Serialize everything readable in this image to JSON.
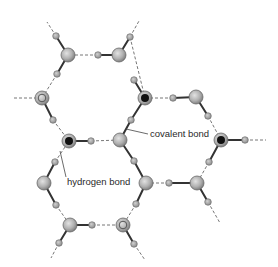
{
  "diagram": {
    "labels": {
      "covalent": "covalent bond",
      "hydrogen": "hydrogen bond"
    },
    "colors": {
      "oxygen_fill": "#b8b8b8",
      "oxygen_stroke": "#6a6a6a",
      "oxygen_dark": "#111111",
      "hydrogen_fill": "#a8a8a8",
      "covalent_line": "#333333",
      "hbond_line": "#777777",
      "text": "#2a2a2a"
    },
    "oxygens": [
      {
        "id": "O1",
        "x": 68,
        "y": 55,
        "style": "plain"
      },
      {
        "id": "O2",
        "x": 119,
        "y": 55,
        "style": "plain"
      },
      {
        "id": "O3",
        "x": 42,
        "y": 98,
        "style": "ringed"
      },
      {
        "id": "O4",
        "x": 145,
        "y": 98,
        "style": "dark"
      },
      {
        "id": "O5",
        "x": 196,
        "y": 97,
        "style": "plain"
      },
      {
        "id": "O6",
        "x": 69,
        "y": 141,
        "style": "dark"
      },
      {
        "id": "O7",
        "x": 120,
        "y": 140,
        "style": "plain"
      },
      {
        "id": "O8",
        "x": 221,
        "y": 140,
        "style": "dark"
      },
      {
        "id": "O9",
        "x": 44,
        "y": 183,
        "style": "plain"
      },
      {
        "id": "O10",
        "x": 146,
        "y": 183,
        "style": "plain"
      },
      {
        "id": "O11",
        "x": 197,
        "y": 183,
        "style": "plain"
      },
      {
        "id": "O12",
        "x": 70,
        "y": 225,
        "style": "plain"
      },
      {
        "id": "O13",
        "x": 123,
        "y": 225,
        "style": "ringed"
      }
    ],
    "hydrogens": [
      {
        "x": 56,
        "y": 36
      },
      {
        "x": 130,
        "y": 37
      },
      {
        "x": 98,
        "y": 55
      },
      {
        "x": 57,
        "y": 74
      },
      {
        "x": 134,
        "y": 80
      },
      {
        "x": 53,
        "y": 120
      },
      {
        "x": 131,
        "y": 120
      },
      {
        "x": 173,
        "y": 98
      },
      {
        "x": 208,
        "y": 116
      },
      {
        "x": 91,
        "y": 141
      },
      {
        "x": 55,
        "y": 162
      },
      {
        "x": 134,
        "y": 161
      },
      {
        "x": 209,
        "y": 162
      },
      {
        "x": 245,
        "y": 140
      },
      {
        "x": 56,
        "y": 205
      },
      {
        "x": 169,
        "y": 183
      },
      {
        "x": 136,
        "y": 204
      },
      {
        "x": 208,
        "y": 202
      },
      {
        "x": 92,
        "y": 225
      },
      {
        "x": 59,
        "y": 243
      },
      {
        "x": 134,
        "y": 244
      }
    ],
    "covalent_bonds": [
      [
        68,
        55,
        56,
        36
      ],
      [
        68,
        55,
        57,
        74
      ],
      [
        119,
        55,
        130,
        37
      ],
      [
        119,
        55,
        98,
        55
      ],
      [
        42,
        98,
        53,
        120
      ],
      [
        145,
        98,
        134,
        80
      ],
      [
        145,
        98,
        131,
        120
      ],
      [
        196,
        97,
        173,
        98
      ],
      [
        196,
        97,
        208,
        116
      ],
      [
        69,
        141,
        91,
        141
      ],
      [
        120,
        140,
        131,
        120
      ],
      [
        120,
        140,
        134,
        161
      ],
      [
        221,
        140,
        245,
        140
      ],
      [
        221,
        140,
        209,
        162
      ],
      [
        44,
        183,
        55,
        162
      ],
      [
        44,
        183,
        56,
        205
      ],
      [
        146,
        183,
        134,
        161
      ],
      [
        146,
        183,
        136,
        204
      ],
      [
        197,
        183,
        169,
        183
      ],
      [
        197,
        183,
        208,
        202
      ],
      [
        70,
        225,
        92,
        225
      ],
      [
        70,
        225,
        59,
        243
      ],
      [
        123,
        225,
        134,
        244
      ]
    ],
    "hydrogen_bonds": [
      [
        56,
        36,
        47,
        22
      ],
      [
        130,
        37,
        139,
        21
      ],
      [
        98,
        55,
        68,
        55
      ],
      [
        57,
        74,
        42,
        98
      ],
      [
        130,
        37,
        145,
        98
      ],
      [
        42,
        98,
        12,
        98
      ],
      [
        53,
        120,
        69,
        141
      ],
      [
        173,
        98,
        145,
        98
      ],
      [
        208,
        116,
        221,
        140
      ],
      [
        91,
        141,
        120,
        140
      ],
      [
        245,
        140,
        266,
        140
      ],
      [
        55,
        162,
        69,
        141
      ],
      [
        209,
        162,
        197,
        183
      ],
      [
        56,
        205,
        70,
        225
      ],
      [
        169,
        183,
        146,
        183
      ],
      [
        136,
        204,
        123,
        225
      ],
      [
        208,
        202,
        220,
        223
      ],
      [
        92,
        225,
        123,
        225
      ],
      [
        59,
        243,
        51,
        258
      ],
      [
        134,
        244,
        145,
        260
      ]
    ],
    "callouts": [
      {
        "text_ref": "covalent",
        "text_x": 150,
        "text_y": 137,
        "line": [
          148,
          134,
          126,
          129
        ]
      },
      {
        "text_ref": "hydrogen",
        "text_x": 67,
        "text_y": 185,
        "line": [
          66,
          177,
          60,
          151
        ]
      }
    ]
  }
}
